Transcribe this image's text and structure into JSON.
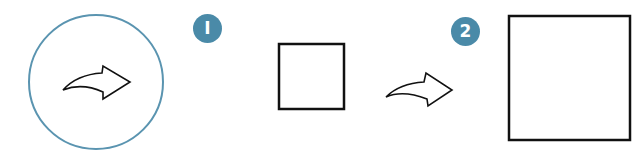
{
  "diagram": {
    "type": "step-sequence",
    "steps": [
      {
        "number": "1",
        "description": "small square"
      },
      {
        "number": "2",
        "description": "large square"
      }
    ],
    "icons": {
      "start": "redo-arrow-in-circle-icon",
      "transition": "curved-right-arrow-icon"
    },
    "colors": {
      "accent": "#4a8aa8",
      "stroke": "#111111",
      "background": "#ffffff"
    }
  },
  "badges": {
    "step1": "I",
    "step2": "2"
  }
}
